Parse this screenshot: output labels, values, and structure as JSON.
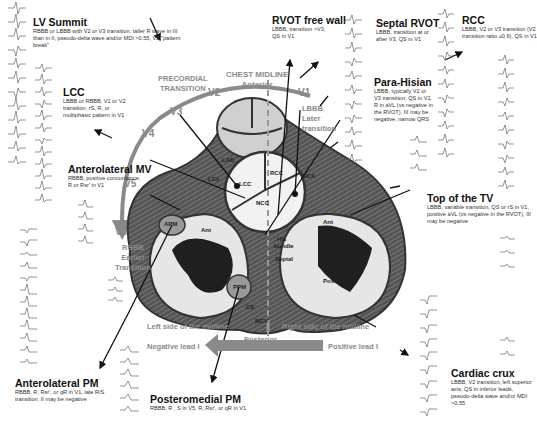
{
  "sites": [
    {
      "id": "lv-summit",
      "title": "LV Summit",
      "desc": "RBBB or LBBB with V2 or V3 transition, taller R wave in III than in II, pseudo-delta wave and/or MDI >0.55, V2 \"pattern break\""
    },
    {
      "id": "rvot-free-wall",
      "title": "RVOT free wall",
      "desc": "LBBB, transition >V3, QS in V1"
    },
    {
      "id": "septal-rvot",
      "title": "Septal RVOT",
      "desc": "LBBB, transition at or after V3, QS in V1"
    },
    {
      "id": "rcc",
      "title": "RCC",
      "desc": "LBBB, V2 or V3 transition (V2 transition ratio ≥0.6), QS in V1"
    },
    {
      "id": "lcc",
      "title": "LCC",
      "desc": "LBBB or RBBB, V1 or V2 transition, rS, R, or multiphasic pattern in V1"
    },
    {
      "id": "para-hisian",
      "title": "Para-Hisian",
      "desc": "LBBB, typically V2 or V3 transition, QS in V1, R in aVL (vs negative in the RVOT), III may be negative, narrow QRS"
    },
    {
      "id": "anterolateral-mv",
      "title": "Anterolateral MV",
      "desc": "RBBB, positive concordance, R or Rsr' in V1"
    },
    {
      "id": "top-of-tv",
      "title": "Top of the TV",
      "desc": "LBBB, variable transition, QS or rS in V1, positive aVL (vs negative in the RVOT), III may be negative"
    },
    {
      "id": "anterolateral-pm",
      "title": "Anterolateral PM",
      "desc": "RBBB, R, Rsr', or qR in V1, late R/S transition, II may be negative"
    },
    {
      "id": "posteromedial-pm",
      "title": "Posteromedial PM",
      "desc": "RBBB, R , S in V5, R, Rsr', or qR in V1"
    },
    {
      "id": "cardiac-crux",
      "title": "Cardiac crux",
      "desc": "LBBB, V2 transition, left superior axis, QS in inferior leads, pseudo-delta wave and/or MDI >0.55"
    }
  ],
  "orientation": {
    "precordial_transition": [
      "PRECORDIAL",
      "TRANSITION"
    ],
    "chest_midline": "CHEST MIDLINE",
    "anterior": "Anterior",
    "posterior": "Posterior",
    "leads": [
      "V1",
      "V2",
      "V3",
      "V4",
      "V5",
      "V6"
    ],
    "lbbb_label": [
      "LBBB",
      "Later",
      "transition"
    ],
    "rbbb_label": [
      "RBBB",
      "Earlier",
      "Transition"
    ],
    "left_side": "Left side of the midline",
    "right_side": "Right side of the midline",
    "negative_lead": "Negative lead I",
    "positive_lead": "Positive lead I"
  },
  "anatomy": {
    "lcc": "LCC",
    "rcc": "RCC",
    "ncc": "NCC",
    "lad": "LAD",
    "lcx": "LCx",
    "rca": "RCA",
    "apm": "APM",
    "ppm": "PPM",
    "lv_ant": "Ant",
    "lv_post": "Post",
    "rv_ant": "Ant",
    "rv_post": "Post",
    "his_bundle": [
      "His",
      "bundle"
    ],
    "septal": "Septal",
    "cs": "CS",
    "mcv": "MCV"
  },
  "ecg_leads": [
    "I",
    "II",
    "III",
    "aVR",
    "aVL",
    "aVF",
    "V1",
    "V2",
    "V3",
    "V4",
    "V5",
    "V6"
  ],
  "colors": {
    "gray_text": "#8a8a8a",
    "arrow": "#888888",
    "wall_dark": "#444444",
    "cavity_light": "#e4e4e4",
    "cavity_dark": "#222222"
  }
}
